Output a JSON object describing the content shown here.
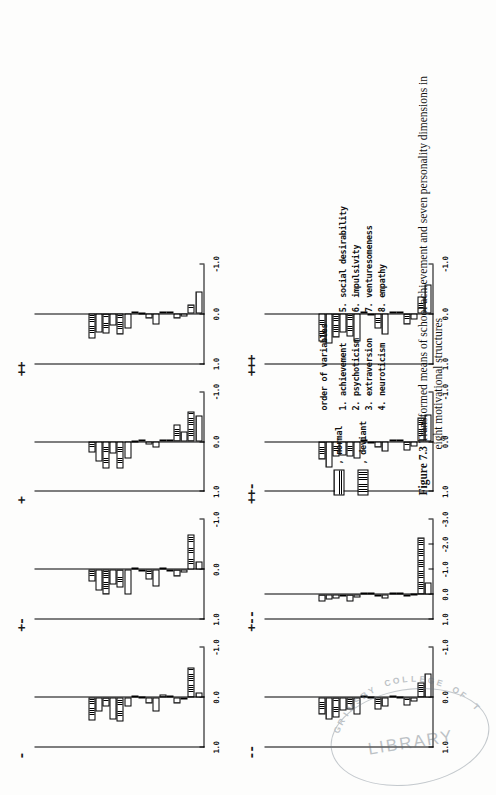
{
  "document": {
    "figure_number": "Figure 7.3",
    "caption_line1": "Transformed means of school achievement and seven personality dimensions in",
    "caption_line2": "eight motivational structures"
  },
  "legend": {
    "items": [
      {
        "label": ", normal",
        "pattern": "horizontal-lines"
      },
      {
        "label": ", deviant",
        "pattern": "vertical-lines"
      }
    ]
  },
  "variable_key": {
    "title": "order of variables",
    "left_column": [
      "1. achievement",
      "2. psychoticism",
      "3. extraversion",
      "4. neuroticism"
    ],
    "right_column": [
      "5. social desirability",
      "6. impulsivity",
      "7. venturesomeness",
      "8. empathy"
    ]
  },
  "stamp": {
    "arc_text": "GRIMSBY COLLEGE OF T",
    "word": "LIBRARY"
  },
  "chart_data": {
    "type": "bar",
    "title": "Transformed means of school achievement and seven personality dimensions in eight motivational structures",
    "xlabel": "",
    "ylabel": "transformed mean",
    "grid": false,
    "legend_position": "below-left",
    "categories": [
      "1. achievement",
      "2. psychoticism",
      "3. extraversion",
      "4. neuroticism",
      "5. social desirability",
      "6. impulsivity",
      "7. venturesomeness",
      "8. empathy"
    ],
    "series_names": [
      "normal",
      "deviant"
    ],
    "panels": [
      {
        "name": "-",
        "ylim": [
          -1.0,
          1.0
        ],
        "yticks": [
          1.0,
          0.0,
          -1.0
        ],
        "yticklabels": [
          "1.0",
          "0.0",
          "-1.0"
        ],
        "series": [
          {
            "name": "normal",
            "values": [
              -0.1,
              0.05,
              -0.02,
              0.3,
              0.02,
              0.2,
              0.45,
              0.3
            ]
          },
          {
            "name": "deviant",
            "values": [
              -0.6,
              0.12,
              -0.05,
              0.12,
              -0.03,
              0.5,
              0.18,
              0.48
            ]
          }
        ]
      },
      {
        "name": "+-",
        "ylim": [
          -1.0,
          1.0
        ],
        "yticks": [
          1.0,
          0.0,
          -1.0
        ],
        "yticklabels": [
          "1.0",
          "0.0",
          "-1.0"
        ],
        "series": [
          {
            "name": "normal",
            "values": [
              -0.15,
              0.06,
              0.05,
              0.35,
              0.04,
              0.5,
              0.3,
              0.42
            ]
          },
          {
            "name": "deviant",
            "values": [
              -0.7,
              0.14,
              -0.04,
              0.2,
              -0.02,
              0.36,
              0.5,
              0.25
            ]
          }
        ]
      },
      {
        "name": "+",
        "ylim": [
          -1.0,
          1.0
        ],
        "yticks": [
          1.0,
          0.0,
          -1.0
        ],
        "yticklabels": [
          "1.0",
          "0.0",
          "-1.0"
        ],
        "series": [
          {
            "name": "normal",
            "values": [
              -0.52,
              -0.2,
              -0.05,
              0.12,
              0.0,
              0.35,
              0.25,
              0.4
            ]
          },
          {
            "name": "deviant",
            "values": [
              -0.62,
              -0.35,
              -0.02,
              0.05,
              0.02,
              0.55,
              0.55,
              0.22
            ]
          }
        ]
      },
      {
        "name": "++",
        "ylim": [
          -1.0,
          1.0
        ],
        "yticks": [
          1.0,
          0.0,
          -1.0
        ],
        "yticklabels": [
          "1.0",
          "0.0",
          "-1.0"
        ],
        "series": [
          {
            "name": "normal",
            "values": [
              -0.45,
              0.06,
              -0.04,
              0.22,
              0.02,
              0.3,
              0.24,
              0.38
            ]
          },
          {
            "name": "deviant",
            "values": [
              -0.18,
              0.1,
              -0.02,
              0.1,
              -0.02,
              0.42,
              0.4,
              0.5
            ]
          }
        ]
      },
      {
        "name": "--",
        "ylim": [
          -1.0,
          1.0
        ],
        "yticks": [
          1.0,
          0.0,
          -1.0
        ],
        "yticklabels": [
          "1.0",
          "0.0",
          "-1.0"
        ],
        "series": [
          {
            "name": "normal",
            "values": [
              -0.48,
              0.08,
              0.02,
              0.18,
              0.03,
              0.35,
              0.28,
              0.45
            ]
          },
          {
            "name": "deviant",
            "values": [
              -0.3,
              0.16,
              -0.03,
              0.26,
              -0.02,
              0.25,
              0.42,
              0.35
            ]
          }
        ]
      },
      {
        "name": "+--",
        "ylim": [
          -3.0,
          1.0
        ],
        "yticks": [
          1.0,
          0.0,
          -1.0,
          -2.0,
          -3.0
        ],
        "yticklabels": [
          "1.0",
          "0.0",
          "-1.0",
          "-2.0",
          "-3.0"
        ],
        "series": [
          {
            "name": "normal",
            "values": [
              -0.45,
              0.05,
              0.02,
              0.18,
              0.02,
              0.12,
              0.1,
              0.22
            ]
          },
          {
            "name": "deviant",
            "values": [
              -2.3,
              0.1,
              -0.02,
              0.08,
              -0.02,
              0.3,
              0.2,
              0.3
            ]
          }
        ]
      },
      {
        "name": "++-",
        "ylim": [
          -1.0,
          1.0
        ],
        "yticks": [
          1.0,
          0.0,
          -1.0
        ],
        "yticklabels": [
          "1.0",
          "0.0",
          "-1.0"
        ],
        "series": [
          {
            "name": "normal",
            "values": [
              -0.55,
              0.1,
              -0.05,
              0.2,
              0.03,
              0.35,
              0.28,
              0.52
            ]
          },
          {
            "name": "deviant",
            "values": [
              -0.48,
              0.18,
              -0.02,
              0.12,
              -0.04,
              0.3,
              0.3,
              0.36
            ]
          }
        ]
      },
      {
        "name": "+++",
        "ylim": [
          -1.0,
          1.0
        ],
        "yticks": [
          1.0,
          0.0,
          -1.0
        ],
        "yticklabels": [
          "1.0",
          "0.0",
          "-1.0"
        ],
        "series": [
          {
            "name": "normal",
            "values": [
              -0.6,
              0.12,
              -0.03,
              0.42,
              0.03,
              0.55,
              0.38,
              0.6
            ]
          },
          {
            "name": "deviant",
            "values": [
              -0.35,
              0.22,
              -0.05,
              0.3,
              -0.03,
              0.45,
              0.48,
              0.55
            ]
          }
        ]
      }
    ]
  }
}
